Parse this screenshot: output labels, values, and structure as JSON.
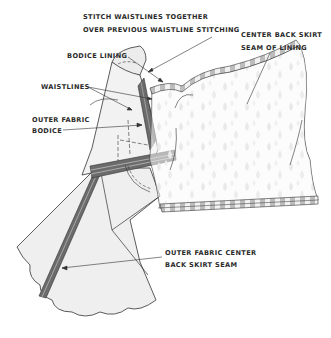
{
  "diagram": {
    "labels": {
      "stitch_waistlines": {
        "line1": "STITCH WAISTLINES TOGETHER",
        "line2": "OVER PREVIOUS WAISTLINE STITCHING"
      },
      "center_back_lining": {
        "line1": "CENTER BACK SKIRT",
        "line2": "SEAM OF LINING"
      },
      "bodice_lining": {
        "line1": "BODICE LINING"
      },
      "waistlines": {
        "line1": "WAISTLINES"
      },
      "outer_bodice": {
        "line1": "OUTER FABRIC",
        "line2": "BODICE"
      },
      "outer_center_back": {
        "line1": "OUTER FABRIC CENTER",
        "line2": "BACK SKIRT SEAM"
      }
    },
    "colors": {
      "outline": "#333333",
      "fabric_fill": "#efefef",
      "seam_dark": "#6b6b6b",
      "lining_fill": "#fafafa",
      "lining_drop": "#d4d4d4",
      "text": "#2a2a2a"
    }
  }
}
